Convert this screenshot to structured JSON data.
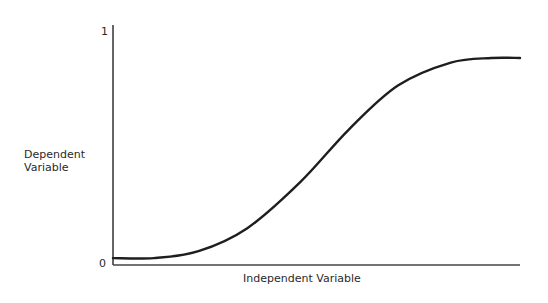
{
  "chart_data": {
    "type": "line",
    "title": "",
    "xlabel": "Independent Variable",
    "ylabel": "Dependent Variable",
    "ylabel_lines": [
      "Dependent",
      "Variable"
    ],
    "y_ticks": [
      "1",
      "0"
    ],
    "ylim": [
      0,
      1
    ],
    "xlim": [
      0,
      1
    ],
    "grid": false,
    "legend": null,
    "series": [
      {
        "name": "sigmoid curve",
        "x": [
          0.0,
          0.1,
          0.21,
          0.33,
          0.46,
          0.58,
          0.7,
          0.83,
          0.93,
          1.0
        ],
        "values": [
          0.03,
          0.03,
          0.06,
          0.16,
          0.36,
          0.59,
          0.78,
          0.88,
          0.9,
          0.9
        ]
      }
    ]
  }
}
